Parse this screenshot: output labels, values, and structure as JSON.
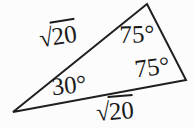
{
  "figure": {
    "colors": {
      "background": "#fcfcfc",
      "line": "#1f1f1f",
      "text": "#1a1a1a"
    },
    "triangle": {
      "points": "13,112 147,4 186,80",
      "stroke_width": "2"
    },
    "angles": {
      "top": {
        "text": "75°"
      },
      "right": {
        "text": "75°"
      },
      "left": {
        "text": "30°"
      }
    },
    "sides": {
      "upper_left": {
        "radical": "√",
        "radicand": "20"
      },
      "bottom": {
        "radical": "√",
        "radicand": "20"
      }
    }
  }
}
